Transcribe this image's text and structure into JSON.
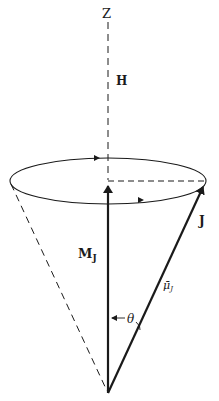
{
  "diagram": {
    "type": "vector-precession-cone",
    "labels": {
      "axis": "Z",
      "field": "H",
      "projection_main": "M",
      "projection_sub": "J",
      "angular_momentum": "J",
      "moment_main": "μ̄",
      "moment_sub": "J",
      "angle": "θ"
    },
    "colors": {
      "ink": "#1a1a1a",
      "background": "#ffffff"
    }
  }
}
